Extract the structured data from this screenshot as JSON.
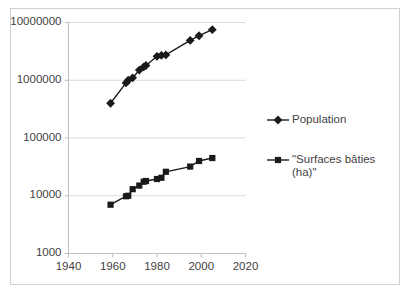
{
  "chart_data": {
    "type": "line",
    "title": "",
    "xlabel": "",
    "ylabel": "",
    "yscale": "log",
    "xlim": [
      1940,
      2020
    ],
    "ylim": [
      1000,
      10000000
    ],
    "grid": true,
    "legend_position": "right",
    "y_ticks": [
      "1000",
      "10000",
      "100000",
      "1000000",
      "10000000"
    ],
    "y_tick_values": [
      1000,
      10000,
      100000,
      1000000,
      10000000
    ],
    "x_ticks": [
      "1940",
      "1960",
      "1980",
      "2000",
      "2020"
    ],
    "x_tick_values": [
      1940,
      1960,
      1980,
      2000,
      2020
    ],
    "series": [
      {
        "name": "Population",
        "marker": "diamond",
        "color": "#1a1a1a",
        "x": [
          1959,
          1966,
          1967,
          1969,
          1972,
          1974,
          1975,
          1980,
          1982,
          1984,
          1995,
          1999,
          2005
        ],
        "y": [
          400000,
          900000,
          1000000,
          1100000,
          1500000,
          1700000,
          1800000,
          2600000,
          2700000,
          2750000,
          4900000,
          5900000,
          7500000
        ]
      },
      {
        "name": "\"Surfaces bâties (ha)\"",
        "marker": "square",
        "color": "#1a1a1a",
        "x": [
          1959,
          1966,
          1967,
          1969,
          1972,
          1974,
          1975,
          1980,
          1982,
          1984,
          1995,
          1999,
          2005
        ],
        "y": [
          7000,
          9800,
          10000,
          13000,
          15000,
          17500,
          18000,
          19500,
          20500,
          26000,
          32000,
          40000,
          45000
        ]
      }
    ]
  },
  "legend": {
    "entries": [
      {
        "label": "Population",
        "marker": "diamond"
      },
      {
        "label": "\"Surfaces bâties\n(ha)\"",
        "marker": "square"
      }
    ]
  }
}
